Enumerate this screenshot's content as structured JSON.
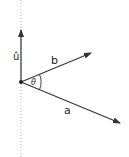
{
  "diagram": {
    "colors": {
      "vector": "#333333",
      "axis": "#b0b0b0",
      "background": "#ffffff"
    },
    "labels": {
      "unit_vector": "û",
      "vector_b": "b",
      "vector_a": "a",
      "angle": "θ"
    },
    "elements": [
      {
        "name": "axis-line",
        "style": "dotted",
        "direction": "vertical"
      },
      {
        "name": "unit-vector-u",
        "direction": "up"
      },
      {
        "name": "vector-b",
        "direction": "up-right"
      },
      {
        "name": "vector-a",
        "direction": "down-right"
      },
      {
        "name": "angle-arc",
        "between": [
          "a",
          "b"
        ]
      }
    ]
  }
}
